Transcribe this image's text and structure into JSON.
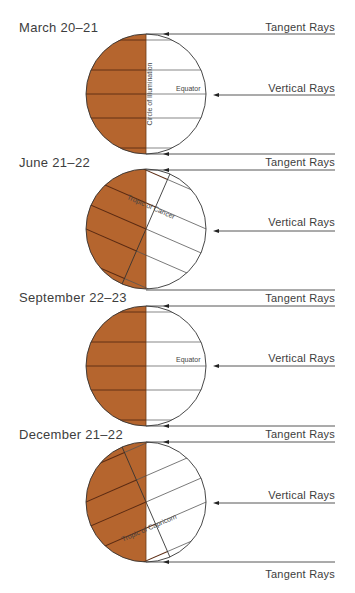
{
  "colors": {
    "night_fill": "#b5652e",
    "night_line": "#5a2a12",
    "day_fill": "#ffffff",
    "line": "#3a3a3a",
    "text": "#3d3d3d"
  },
  "panels": [
    {
      "title": "March 20–21",
      "tilt_deg": 0,
      "center": [
        146,
        94
      ],
      "radius": 60,
      "title_pos": [
        19,
        32
      ],
      "tangent_top": {
        "y": 34,
        "label": "Tangent Rays",
        "label_y": 31,
        "arrow": true
      },
      "vertical": {
        "y": 95,
        "label": "Vertical Rays",
        "label_y": 92
      },
      "tangent_bottom": {
        "y": 154,
        "label": "",
        "arrow": true
      },
      "labels": [
        {
          "text": "Equator",
          "x": 176,
          "y": 91,
          "rotate": 0
        },
        {
          "text": "Circle of Illumination",
          "x": 152,
          "y": 94,
          "rotate": -90
        }
      ]
    },
    {
      "title": "June 21–22",
      "tilt_deg": 23.5,
      "center": [
        146,
        229
      ],
      "radius": 60,
      "title_pos": [
        19,
        167
      ],
      "tangent_top": {
        "y": 170,
        "label": "Tangent Rays",
        "label_y": 166,
        "arrow": true
      },
      "vertical": {
        "y": 231,
        "label": "Vertical Rays",
        "label_y": 226
      },
      "tangent_bottom": {
        "y": 290,
        "label": "",
        "arrow": false
      },
      "labels": [
        {
          "text": "Tropic of Cancer",
          "x": 150,
          "y": 209,
          "rotate": 23.5
        }
      ]
    },
    {
      "title": "September 22–23",
      "tilt_deg": 0,
      "center": [
        146,
        366
      ],
      "radius": 60,
      "title_pos": [
        19,
        302
      ],
      "tangent_top": {
        "y": 306,
        "label": "Tangent Rays",
        "label_y": 302,
        "arrow": true
      },
      "vertical": {
        "y": 366,
        "label": "Vertical Rays",
        "label_y": 362
      },
      "tangent_bottom": {
        "y": 426,
        "label": "",
        "arrow": true
      },
      "labels": [
        {
          "text": "Equator",
          "x": 176,
          "y": 362,
          "rotate": 0
        }
      ]
    },
    {
      "title": "December 21–22",
      "tilt_deg": -23.5,
      "center": [
        146,
        502
      ],
      "radius": 60,
      "title_pos": [
        19,
        439
      ],
      "tangent_top": {
        "y": 442,
        "label": "Tangent Rays",
        "label_y": 438,
        "arrow": true
      },
      "vertical": {
        "y": 503,
        "label": "Vertical Rays",
        "label_y": 499
      },
      "tangent_bottom": {
        "y": 562,
        "label": "Tangent Rays",
        "label_y": 578,
        "arrow": true
      },
      "labels": [
        {
          "text": "Tropic of Capricorn",
          "x": 150,
          "y": 530,
          "rotate": -23.5
        }
      ]
    }
  ],
  "ray_end_x": 335
}
